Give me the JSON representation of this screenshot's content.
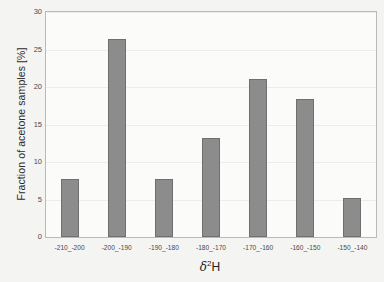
{
  "chart_data": {
    "type": "bar",
    "title": "",
    "xlabel": "δ²H",
    "xlabel_symbol": "δ",
    "xlabel_superscript": "2",
    "xlabel_suffix": "H",
    "ylabel": "Fraction of acetone samples [%]",
    "categories": [
      "-210_-200",
      "-200_-190",
      "-190_-180",
      "-180_-170",
      "-170_-160",
      "-160_-150",
      "-150_-140"
    ],
    "values": [
      7.8,
      26.4,
      7.8,
      13.2,
      21.1,
      18.4,
      5.2
    ],
    "ylim": [
      0,
      30
    ],
    "yticks": [
      0,
      5,
      10,
      15,
      20,
      25,
      30
    ],
    "ytick_labels": [
      "0",
      "5",
      "10",
      "15",
      "20",
      "25",
      "30"
    ],
    "grid": true,
    "grid_axis": "y",
    "legend": null,
    "bar_color": "#8c8c8c",
    "bar_edge_color": "#6f6f6f",
    "grid_color": "#ececea",
    "axis_color": "#b9b9b9",
    "plot_background": "#fbfbfa",
    "figure_background": "#f4f4f2"
  }
}
